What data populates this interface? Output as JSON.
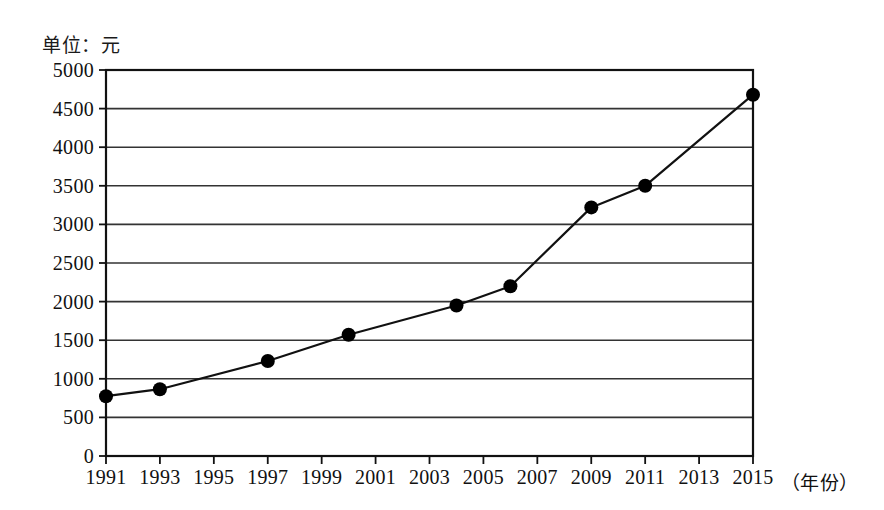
{
  "unit_label": "单位：元",
  "axis": {
    "x_title": "（年份）",
    "y_ticks": [
      "5000",
      "4500",
      "4000",
      "3500",
      "3000",
      "2500",
      "2000",
      "1500",
      "1000",
      "500",
      "0"
    ],
    "x_ticks": [
      "1991",
      "1993",
      "1995",
      "1997",
      "1999",
      "2001",
      "2003",
      "2005",
      "2007",
      "2009",
      "2011",
      "2013",
      "2015"
    ]
  },
  "style": {
    "line_color": "#111111",
    "marker_color": "#000000",
    "grid_color": "#333333",
    "frame_color": "#111111",
    "background": "#ffffff"
  },
  "chart_data": {
    "type": "line",
    "title": "",
    "subtitle": "",
    "xlabel": "（年份）",
    "ylabel": "单位：元",
    "grid": true,
    "legend": "none",
    "xlim": [
      1991,
      2015
    ],
    "ylim": [
      0,
      5000
    ],
    "y_tick_step": 500,
    "x_tick_step": 2,
    "x": [
      1991,
      1993,
      1997,
      2000,
      2004,
      2006,
      2009,
      2011,
      2015
    ],
    "values": [
      775,
      865,
      1230,
      1570,
      1950,
      2200,
      3220,
      3500,
      4680
    ],
    "points": [
      {
        "year": 1991,
        "value": 775
      },
      {
        "year": 1993,
        "value": 865
      },
      {
        "year": 1997,
        "value": 1230
      },
      {
        "year": 2000,
        "value": 1570
      },
      {
        "year": 2004,
        "value": 1950
      },
      {
        "year": 2006,
        "value": 2200
      },
      {
        "year": 2009,
        "value": 3220
      },
      {
        "year": 2011,
        "value": 3500
      },
      {
        "year": 2015,
        "value": 4680
      }
    ]
  }
}
